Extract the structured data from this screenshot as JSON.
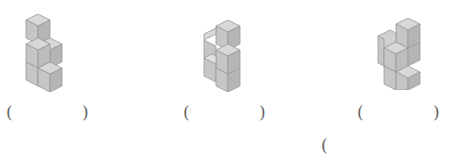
{
  "header": {
    "text": "",
    "note": "cropped instruction line at top edge"
  },
  "figures": [
    {
      "label": "figure-1",
      "description": "stack of unit cubes"
    },
    {
      "label": "figure-2",
      "description": "stack of unit cubes"
    },
    {
      "label": "figure-3",
      "description": "stack of unit cubes"
    }
  ],
  "answers": [
    {
      "open": "(",
      "close": ")",
      "value": ""
    },
    {
      "open": "(",
      "close": ")",
      "value": ""
    },
    {
      "open": "(",
      "close": ")",
      "value": ""
    },
    {
      "open": "(",
      "value": ""
    }
  ],
  "colors": {
    "cube_top": "#d6d6d6",
    "cube_front": "#c4c4c4",
    "cube_side": "#b3b3b3",
    "cube_edge": "#8f8f8f"
  }
}
